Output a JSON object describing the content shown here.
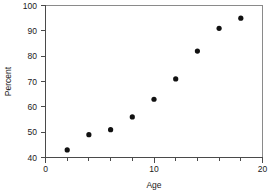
{
  "chart_data": {
    "type": "scatter",
    "title": "",
    "xlabel": "Age",
    "ylabel": "Percent",
    "xlim": [
      0,
      20
    ],
    "ylim": [
      40,
      100
    ],
    "grid": false,
    "legend": null,
    "x": [
      2,
      4,
      6,
      8,
      10,
      12,
      14,
      16,
      18
    ],
    "values": [
      43,
      49,
      51,
      56,
      63,
      71,
      82,
      91,
      95
    ],
    "series": [
      {
        "name": "Percent vs Age",
        "x": [
          2,
          4,
          6,
          8,
          10,
          12,
          14,
          16,
          18
        ],
        "values": [
          43,
          49,
          51,
          56,
          63,
          71,
          82,
          91,
          95
        ],
        "marker": "filled-circle",
        "color": "#111111"
      }
    ],
    "xticks": [
      0,
      10,
      20
    ],
    "xtick_labels": [
      "0",
      "10",
      "20"
    ],
    "xminor_ticks": [
      2,
      4,
      6,
      8,
      12,
      14,
      16,
      18
    ],
    "yticks": [
      40,
      50,
      60,
      70,
      80,
      90,
      100
    ],
    "ytick_labels": [
      "40",
      "50",
      "60",
      "70",
      "80",
      "90",
      "100"
    ],
    "colors": {
      "marker": "#111111",
      "axis": "#4a4a4a",
      "frame": "#8a8a8a",
      "text": "#1a1a1a",
      "background": "#ffffff"
    }
  }
}
